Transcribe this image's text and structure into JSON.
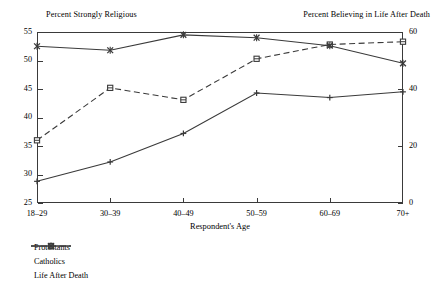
{
  "chart_data": {
    "type": "line",
    "title": "",
    "xlabel": "Respondent's Age",
    "ylabel_left": "Percent Strongly Religious",
    "ylabel_right": "Percent Believing in Life After Death",
    "categories": [
      "18–29",
      "30–39",
      "40–49",
      "50–59",
      "60–69",
      "70+"
    ],
    "ylim_left": [
      25,
      55
    ],
    "yticks_left": [
      25,
      30,
      35,
      40,
      45,
      50,
      55
    ],
    "ylim_right": [
      0,
      60
    ],
    "yticks_right": [
      0,
      20,
      40,
      60
    ],
    "grid": false,
    "legend_position": "below-left",
    "series": [
      {
        "name": "Protestants",
        "axis": "left",
        "line": "dashed",
        "marker": "square",
        "values": [
          36.0,
          45.2,
          43.1,
          50.3,
          52.8,
          53.3
        ]
      },
      {
        "name": "Catholics",
        "axis": "left",
        "line": "solid",
        "marker": "plus",
        "values": [
          28.8,
          32.2,
          37.2,
          44.3,
          43.5,
          44.5
        ]
      },
      {
        "name": "Life After Death",
        "axis": "right",
        "line": "solid",
        "marker": "cross",
        "values": [
          52.5,
          51.8,
          54.5,
          54.0,
          52.6,
          49.5
        ]
      }
    ]
  },
  "axis_titles": {
    "left": "Percent Strongly Religious",
    "right": "Percent Believing in Life After Death",
    "x": "Respondent's Age"
  },
  "colors": {
    "ink": "#3a3a3a",
    "background": "#ffffff"
  }
}
